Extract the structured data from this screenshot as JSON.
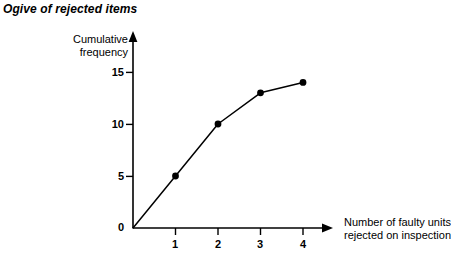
{
  "chart_data": {
    "type": "line",
    "title": "Ogive of rejected items",
    "xlabel": "Number of faulty units rejected on inspection",
    "xlabel_line1": "Number of faulty units",
    "xlabel_line2": "rejected on inspection",
    "ylabel": "Cumulative frequency",
    "ylabel_line1": "Cumulative",
    "ylabel_line2": "frequency",
    "x": [
      0,
      1,
      2,
      3,
      4
    ],
    "values": [
      0,
      5,
      10,
      13,
      14
    ],
    "series": [
      {
        "name": "Cumulative frequency",
        "values": [
          0,
          5,
          10,
          13,
          14
        ]
      }
    ],
    "points": [
      {
        "x": 0,
        "y": 0,
        "marker": false
      },
      {
        "x": 1,
        "y": 5,
        "marker": true
      },
      {
        "x": 2,
        "y": 10,
        "marker": true
      },
      {
        "x": 3,
        "y": 13,
        "marker": true
      },
      {
        "x": 4,
        "y": 14,
        "marker": true
      }
    ],
    "xlim": [
      0,
      4.7
    ],
    "ylim": [
      0,
      18.8
    ],
    "xticks": [
      1,
      2,
      3,
      4
    ],
    "xtick_labels": [
      "1",
      "2",
      "3",
      "4"
    ],
    "yticks": [
      5,
      10,
      15
    ],
    "ytick_labels": [
      "5",
      "10",
      "15"
    ],
    "origin_label": "0",
    "grid": false,
    "legend": false,
    "line_color": "#000000",
    "marker_color": "#000000",
    "axis_color": "#000000",
    "background_color": "#ffffff",
    "axis_arrows": true
  }
}
